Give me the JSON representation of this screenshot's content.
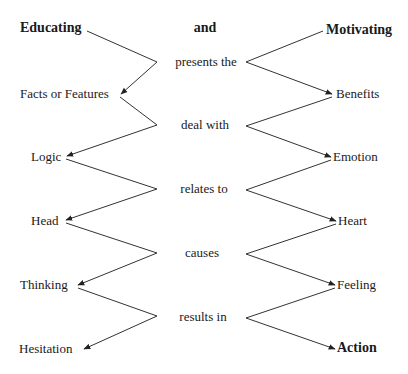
{
  "diagram": {
    "title_left": "Educating",
    "title_center": "and",
    "title_right": "Motivating",
    "connectors": [
      "presents the",
      "deal with",
      "relates to",
      "causes",
      "results in"
    ],
    "left_items": [
      "Facts or Features",
      "Logic",
      "Head",
      "Thinking",
      "Hesitation"
    ],
    "right_items": [
      "Benefits",
      "Emotion",
      "Heart",
      "Feeling",
      "Action"
    ],
    "colors": {
      "text": "#1a1a1a",
      "line": "#333333",
      "background": "#ffffff"
    }
  }
}
